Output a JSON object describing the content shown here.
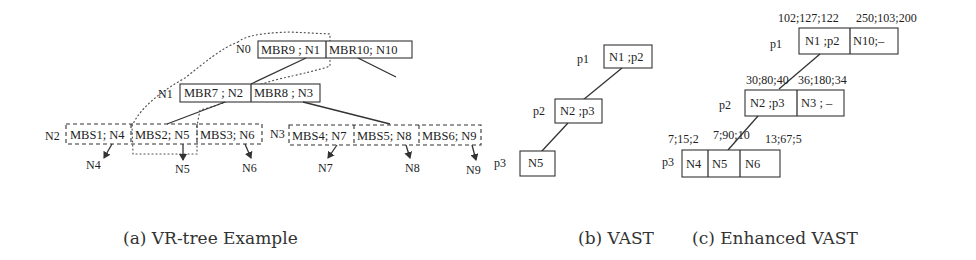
{
  "panel_a": {
    "caption": "(a) VR-tree Example",
    "n0": {
      "label": "N0",
      "entries": [
        "MBR9 ; N1",
        "MBR10; N10"
      ]
    },
    "n1": {
      "label": "N1",
      "entries": [
        "MBR7 ; N2",
        "MBR8 ; N3"
      ]
    },
    "n2": {
      "label": "N2",
      "entries": [
        "MBS1; N4",
        "MBS2; N5",
        "MBS3; N6"
      ]
    },
    "n3": {
      "label": "N3",
      "entries": [
        "MBS4; N7",
        "MBS5; N8",
        "MBS6; N9"
      ]
    },
    "leaves": [
      "N4",
      "N5",
      "N6",
      "N7",
      "N8",
      "N9"
    ]
  },
  "panel_b": {
    "caption": "(b) VAST",
    "p1": {
      "label": "p1",
      "entry": "N1 ;p2"
    },
    "p2": {
      "label": "p2",
      "entry": "N2 ;p3"
    },
    "p3": {
      "label": "p3",
      "entry": "N5"
    }
  },
  "panel_c": {
    "caption": "(c) Enhanced VAST",
    "p1": {
      "label": "p1",
      "entries": [
        "N1 ;p2",
        "N10;–"
      ],
      "annotations": [
        "102;127;122",
        "250;103;200"
      ]
    },
    "p2": {
      "label": "p2",
      "entries": [
        "N2 ;p3",
        "N3 ; –"
      ],
      "annotations": [
        "30;80;40",
        "36;180;34"
      ]
    },
    "p3": {
      "label": "p3",
      "entries": [
        "N4",
        "N5",
        "N6"
      ],
      "annotations": [
        "7;15;2",
        "7;90;10",
        "13;67;5"
      ]
    }
  }
}
